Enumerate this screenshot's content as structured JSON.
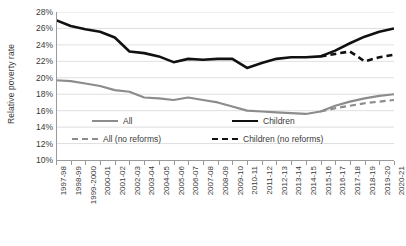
{
  "chart_data": {
    "type": "line",
    "title": "",
    "xlabel": "",
    "ylabel": "Relative poverty rate",
    "ylim": [
      10,
      28
    ],
    "ytick_step": 2,
    "grid": true,
    "grid_axis": "y",
    "legend_position": "inside-bottom-left",
    "yticks": [
      "10%",
      "12%",
      "14%",
      "16%",
      "18%",
      "20%",
      "22%",
      "24%",
      "26%",
      "28%"
    ],
    "ytick_values": [
      10,
      12,
      14,
      16,
      18,
      20,
      22,
      24,
      26,
      28
    ],
    "categories": [
      "1997-98",
      "1998-99",
      "1999-2000",
      "2000-01",
      "2001-02",
      "2002-03",
      "2003-04",
      "2004-05",
      "2005-06",
      "2006-07",
      "2007-08",
      "2008-09",
      "2009-10",
      "2010-11",
      "2011-12",
      "2012-13",
      "2013-14",
      "2014-15",
      "2015-16",
      "2016-17",
      "2017-18",
      "2018-19",
      "2019-20",
      "2020-21"
    ],
    "series": [
      {
        "name": "All",
        "color": "#8c8c8c",
        "style": "solid",
        "width": 2.2,
        "values": [
          19.7,
          19.6,
          19.3,
          19.0,
          18.5,
          18.3,
          17.6,
          17.5,
          17.3,
          17.6,
          17.3,
          17.0,
          16.5,
          16.0,
          15.9,
          15.8,
          15.7,
          15.6,
          15.9,
          16.6,
          17.1,
          17.5,
          17.8,
          18.0
        ]
      },
      {
        "name": "Children",
        "color": "#111111",
        "style": "solid",
        "width": 2.6,
        "values": [
          27.0,
          26.3,
          25.9,
          25.6,
          24.9,
          23.2,
          23.0,
          22.6,
          21.9,
          22.3,
          22.2,
          22.3,
          22.3,
          21.2,
          21.8,
          22.3,
          22.5,
          22.5,
          22.6,
          23.3,
          24.2,
          25.0,
          25.6,
          26.0
        ]
      },
      {
        "name": "All (no reforms)",
        "color": "#8c8c8c",
        "style": "dashed",
        "width": 2.2,
        "start_index": 18,
        "values": [
          null,
          null,
          null,
          null,
          null,
          null,
          null,
          null,
          null,
          null,
          null,
          null,
          null,
          null,
          null,
          null,
          null,
          null,
          15.9,
          16.3,
          16.6,
          16.9,
          17.1,
          17.3
        ]
      },
      {
        "name": "Children (no reforms)",
        "color": "#111111",
        "style": "dashed",
        "width": 2.6,
        "start_index": 18,
        "values": [
          null,
          null,
          null,
          null,
          null,
          null,
          null,
          null,
          null,
          null,
          null,
          null,
          null,
          null,
          null,
          null,
          null,
          null,
          22.6,
          22.9,
          23.2,
          22.0,
          22.5,
          22.8
        ]
      }
    ],
    "legend": [
      {
        "label": "All",
        "color": "#8c8c8c",
        "style": "solid"
      },
      {
        "label": "Children",
        "color": "#111111",
        "style": "solid"
      },
      {
        "label": "All (no reforms)",
        "color": "#8c8c8c",
        "style": "dashed"
      },
      {
        "label": "Children (no reforms)",
        "color": "#111111",
        "style": "dashed"
      }
    ]
  }
}
